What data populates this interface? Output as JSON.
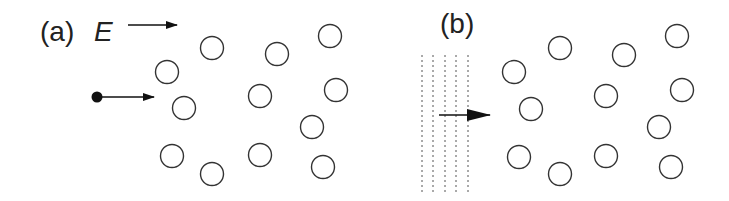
{
  "panels": [
    {
      "label": "(a)",
      "field_label": "E",
      "incident": "particle"
    },
    {
      "label": "(b)",
      "incident": "wave"
    }
  ],
  "scatterers_a": [
    [
      212,
      48
    ],
    [
      277,
      54
    ],
    [
      330,
      36
    ],
    [
      167,
      72
    ],
    [
      260,
      96
    ],
    [
      336,
      90
    ],
    [
      184,
      108
    ],
    [
      312,
      127
    ],
    [
      172,
      156
    ],
    [
      260,
      155
    ],
    [
      212,
      174
    ],
    [
      323,
      167
    ]
  ],
  "scatterers_b": [
    [
      560,
      48
    ],
    [
      624,
      55
    ],
    [
      677,
      36
    ],
    [
      514,
      72
    ],
    [
      606,
      96
    ],
    [
      682,
      90
    ],
    [
      531,
      109
    ],
    [
      659,
      127
    ],
    [
      519,
      157
    ],
    [
      606,
      156
    ],
    [
      560,
      174
    ],
    [
      671,
      167
    ]
  ],
  "colors": {
    "stroke": "#333333",
    "wave": "#555555"
  }
}
